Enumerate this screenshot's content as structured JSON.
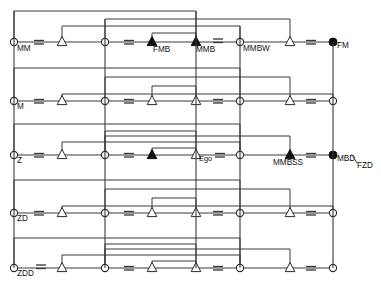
{
  "diagram": {
    "colors": {
      "line": "#3a3a3a",
      "node_fill_open": "#ffffff",
      "node_fill_closed": "#111111",
      "text": "#111111",
      "background": "#ffffff"
    },
    "equals_symbol": "=",
    "rows": [
      {
        "id": "row-mm",
        "label": "MM",
        "y": 42,
        "elements": [
          {
            "kind": "circle-open",
            "x": 14,
            "label": "MM"
          },
          {
            "kind": "triangle-open",
            "x": 62,
            "label": ""
          },
          {
            "kind": "circle-open",
            "x": 105,
            "label": ""
          },
          {
            "kind": "triangle-filled",
            "x": 152,
            "label": "FMB"
          },
          {
            "kind": "triangle-filled",
            "x": 196,
            "label": "MMB"
          },
          {
            "kind": "circle-open",
            "x": 240,
            "label": "MMBW"
          },
          {
            "kind": "triangle-open",
            "x": 290,
            "label": ""
          },
          {
            "kind": "circle-filled",
            "x": 333,
            "label": "FM"
          }
        ],
        "equals_between": [
          [
            14,
            62
          ],
          [
            105,
            152
          ],
          [
            196,
            240
          ],
          [
            290,
            333
          ]
        ]
      },
      {
        "id": "row-m",
        "label": "M",
        "y": 101,
        "elements": [
          {
            "kind": "circle-open",
            "x": 14,
            "label": "M"
          },
          {
            "kind": "triangle-open",
            "x": 62,
            "label": ""
          },
          {
            "kind": "circle-open",
            "x": 105,
            "label": ""
          },
          {
            "kind": "triangle-open",
            "x": 152,
            "label": ""
          },
          {
            "kind": "triangle-open",
            "x": 196,
            "label": ""
          },
          {
            "kind": "circle-open",
            "x": 240,
            "label": ""
          },
          {
            "kind": "triangle-open",
            "x": 290,
            "label": ""
          },
          {
            "kind": "circle-open",
            "x": 333,
            "label": ""
          }
        ],
        "equals_between": [
          [
            14,
            62
          ],
          [
            105,
            152
          ],
          [
            196,
            240
          ],
          [
            290,
            333
          ]
        ]
      },
      {
        "id": "row-z",
        "label": "Z",
        "y": 155,
        "elements": [
          {
            "kind": "circle-open",
            "x": 14,
            "label": "Z"
          },
          {
            "kind": "triangle-open",
            "x": 62,
            "label": ""
          },
          {
            "kind": "circle-open",
            "x": 105,
            "label": ""
          },
          {
            "kind": "triangle-filled",
            "x": 152,
            "label": ""
          },
          {
            "kind": "triangle-open",
            "x": 196,
            "label": "Ego"
          },
          {
            "kind": "circle-open",
            "x": 240,
            "label": ""
          },
          {
            "kind": "triangle-filled",
            "x": 290,
            "label": "MMBSS"
          },
          {
            "kind": "circle-filled",
            "x": 333,
            "label": "MBD/FZD"
          }
        ],
        "equals_between": [
          [
            14,
            62
          ],
          [
            105,
            152
          ],
          [
            196,
            240
          ],
          [
            290,
            333
          ]
        ]
      },
      {
        "id": "row-zd",
        "label": "ZD",
        "y": 213,
        "elements": [
          {
            "kind": "circle-open",
            "x": 14,
            "label": "ZD"
          },
          {
            "kind": "triangle-open",
            "x": 62,
            "label": ""
          },
          {
            "kind": "circle-open",
            "x": 105,
            "label": ""
          },
          {
            "kind": "triangle-open",
            "x": 152,
            "label": ""
          },
          {
            "kind": "triangle-open",
            "x": 196,
            "label": ""
          },
          {
            "kind": "circle-open",
            "x": 240,
            "label": ""
          },
          {
            "kind": "triangle-open",
            "x": 290,
            "label": ""
          },
          {
            "kind": "circle-open",
            "x": 333,
            "label": ""
          }
        ],
        "equals_between": [
          [
            14,
            62
          ],
          [
            105,
            152
          ],
          [
            196,
            240
          ],
          [
            290,
            333
          ]
        ]
      },
      {
        "id": "row-zdd",
        "label": "ZDD",
        "y": 268,
        "elements": [
          {
            "kind": "circle-open",
            "x": 14,
            "label": "ZDD"
          },
          {
            "kind": "triangle-open",
            "x": 62,
            "label": ""
          },
          {
            "kind": "circle-open",
            "x": 105,
            "label": ""
          },
          {
            "kind": "triangle-open",
            "x": 152,
            "label": ""
          },
          {
            "kind": "triangle-open",
            "x": 196,
            "label": ""
          },
          {
            "kind": "circle-open",
            "x": 240,
            "label": ""
          },
          {
            "kind": "triangle-open",
            "x": 290,
            "label": ""
          },
          {
            "kind": "circle-open",
            "x": 333,
            "label": ""
          }
        ],
        "equals_between": [
          [
            14,
            62
          ],
          [
            105,
            152
          ],
          [
            196,
            240
          ],
          [
            290,
            333
          ]
        ]
      }
    ],
    "named_nodes": [
      {
        "name": "MM",
        "row": "row-mm",
        "x": 14
      },
      {
        "name": "FMB",
        "row": "row-mm",
        "x": 152
      },
      {
        "name": "MMB",
        "row": "row-mm",
        "x": 196
      },
      {
        "name": "MMBW",
        "row": "row-mm",
        "x": 240
      },
      {
        "name": "FM",
        "row": "row-mm",
        "x": 333
      },
      {
        "name": "M",
        "row": "row-m",
        "x": 14
      },
      {
        "name": "Z",
        "row": "row-z",
        "x": 14
      },
      {
        "name": "Ego",
        "row": "row-z",
        "x": 196
      },
      {
        "name": "MMBSS",
        "row": "row-z",
        "x": 290
      },
      {
        "name": "MBD/FZD",
        "row": "row-z",
        "x": 333
      },
      {
        "name": "ZD",
        "row": "row-zd",
        "x": 14
      },
      {
        "name": "ZDD",
        "row": "row-zdd",
        "x": 14
      }
    ],
    "fraction_label": {
      "numerator": "MBD",
      "denominator": "FZD"
    }
  }
}
